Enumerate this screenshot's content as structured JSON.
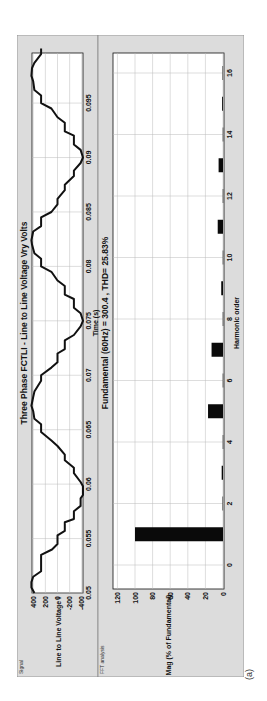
{
  "figure": {
    "caption": "(a)",
    "panels": {
      "signal_label": "Signal",
      "fft_label": "FFT analysis"
    }
  },
  "chart_data": [
    {
      "type": "line",
      "title": "Three Phase FCTLI - Line to Line Voltage Vry Volts",
      "xlabel": "Time (s)",
      "ylabel": "Line to Line Voltage i",
      "xlim": [
        0.05,
        0.1
      ],
      "ylim": [
        -420,
        420
      ],
      "xticks": [
        0.05,
        0.055,
        0.06,
        0.065,
        0.07,
        0.075,
        0.08,
        0.085,
        0.09,
        0.095
      ],
      "xtick_labels": [
        "0.05",
        "0.055",
        "0.06",
        "0.065",
        "0.07",
        "0.075",
        "0.08",
        "0.085",
        "0.09",
        "0.095"
      ],
      "yticks": [
        400,
        200,
        0,
        -200,
        -400
      ],
      "ytick_labels": [
        "400",
        "200",
        "0",
        "-200",
        "-400"
      ],
      "grid": true,
      "series": [
        {
          "name": "Vry",
          "description": "7-level stepped line-to-line voltage, fundamental 60 Hz",
          "x": [
            0.05,
            0.0505,
            0.051,
            0.0515,
            0.052,
            0.0535,
            0.054,
            0.0545,
            0.0553,
            0.0557,
            0.0565,
            0.0568,
            0.0575,
            0.058,
            0.0587,
            0.059,
            0.0598,
            0.0602,
            0.061,
            0.0615,
            0.0622,
            0.0627,
            0.0635,
            0.064,
            0.0648,
            0.0655,
            0.066,
            0.0667,
            0.0672,
            0.068,
            0.0685,
            0.0695,
            0.07,
            0.0707,
            0.0712,
            0.072,
            0.0724,
            0.0732,
            0.0737,
            0.0745,
            0.075,
            0.0757,
            0.0762,
            0.077,
            0.0774,
            0.0782,
            0.0787,
            0.0795,
            0.08,
            0.0807,
            0.0812,
            0.082,
            0.0824,
            0.0832,
            0.0837,
            0.0845,
            0.085,
            0.0857,
            0.0862,
            0.087,
            0.0875,
            0.0883,
            0.0888,
            0.0895,
            0.09,
            0.0907,
            0.0912,
            0.092,
            0.0924,
            0.0932,
            0.0937,
            0.0945,
            0.095,
            0.0957,
            0.0962,
            0.097,
            0.0975,
            0.0982,
            0.0987,
            0.0995,
            0.1
          ],
          "y": [
            380,
            430,
            430,
            400,
            270,
            270,
            90,
            0,
            0,
            -120,
            -120,
            -270,
            -270,
            -380,
            -380,
            -420,
            -420,
            -380,
            -270,
            -270,
            -120,
            -120,
            0,
            100,
            270,
            270,
            380,
            400,
            430,
            400,
            380,
            270,
            270,
            100,
            0,
            0,
            -120,
            -120,
            -270,
            -380,
            -420,
            -380,
            -270,
            -270,
            -120,
            -120,
            0,
            100,
            270,
            270,
            380,
            420,
            430,
            400,
            270,
            270,
            100,
            0,
            0,
            -120,
            -120,
            -270,
            -270,
            -380,
            -420,
            -380,
            -270,
            -270,
            -120,
            -120,
            0,
            100,
            270,
            270,
            380,
            400,
            430,
            420,
            380,
            270,
            270
          ]
        }
      ]
    },
    {
      "type": "bar",
      "title": "Fundamental (60Hz) = 300.4 , THD= 25.83%",
      "xlabel": "Harmonic order",
      "ylabel": "Mag (% of Fundamental)",
      "xlim": [
        -0.8,
        16.8
      ],
      "ylim": [
        0,
        125
      ],
      "xticks": [
        0,
        2,
        4,
        6,
        8,
        10,
        12,
        14,
        16
      ],
      "xtick_labels": [
        "0",
        "2",
        "4",
        "6",
        "8",
        "10",
        "12",
        "14",
        "16"
      ],
      "yticks": [
        0,
        20,
        40,
        60,
        80,
        100,
        120
      ],
      "ytick_labels": [
        "0",
        "20",
        "40",
        "60",
        "80",
        "100",
        "120"
      ],
      "grid": true,
      "categories": [
        0,
        1,
        2,
        3,
        4,
        5,
        6,
        7,
        8,
        9,
        10,
        11,
        12,
        13,
        14,
        15,
        16
      ],
      "values": [
        0,
        100,
        0.5,
        1.5,
        0.3,
        17,
        0.3,
        13,
        0.3,
        2,
        0.3,
        6,
        0.3,
        5,
        0.3,
        1,
        0.5
      ],
      "fundamental_hz": 60,
      "fundamental_value": 300.4,
      "thd_percent": 25.83
    }
  ]
}
